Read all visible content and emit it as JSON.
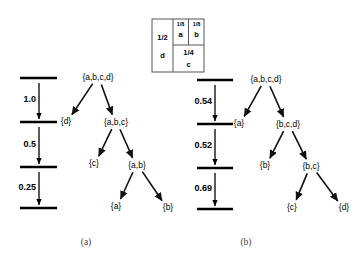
{
  "figure": {
    "caption_a": "(a)",
    "caption_b": "(b)"
  },
  "partition_box": {
    "cells": [
      {
        "name": "left-half",
        "fraction": "1/2",
        "letter": "d"
      },
      {
        "name": "top-right-1",
        "fraction": "1/8",
        "letter": "a"
      },
      {
        "name": "top-right-2",
        "fraction": "1/8",
        "letter": "b"
      },
      {
        "name": "bottom-right",
        "fraction": "1/4",
        "letter": "c"
      }
    ]
  },
  "tree_a": {
    "nodes": [
      {
        "id": "root",
        "label": "{a,b,c,d}",
        "x": 98,
        "y": 78
      },
      {
        "id": "n-d",
        "label": "{d}",
        "x": 66,
        "y": 122
      },
      {
        "id": "n-abc",
        "label": "{a,b,c}",
        "x": 116,
        "y": 123
      },
      {
        "id": "n-c",
        "label": "{c}",
        "x": 94,
        "y": 164
      },
      {
        "id": "n-ab",
        "label": "{a,b}",
        "x": 137,
        "y": 166
      },
      {
        "id": "n-a",
        "label": "{a}",
        "x": 116,
        "y": 207
      },
      {
        "id": "n-b",
        "label": "{b}",
        "x": 168,
        "y": 208
      }
    ],
    "edges": [
      {
        "from": "root",
        "to": "n-d"
      },
      {
        "from": "root",
        "to": "n-abc"
      },
      {
        "from": "n-abc",
        "to": "n-c"
      },
      {
        "from": "n-abc",
        "to": "n-ab"
      },
      {
        "from": "n-ab",
        "to": "n-a"
      },
      {
        "from": "n-ab",
        "to": "n-b"
      }
    ],
    "scale": {
      "bar_x1": 20,
      "bar_x2": 57,
      "arrow_x": 39,
      "levels": [
        78,
        122,
        167,
        208
      ],
      "values": [
        "1.0",
        "0.5",
        "0.25"
      ]
    }
  },
  "tree_b": {
    "nodes": [
      {
        "id": "root",
        "label": "{a,b,c,d}",
        "x": 266,
        "y": 80
      },
      {
        "id": "n-a",
        "label": "{a}",
        "x": 239,
        "y": 124
      },
      {
        "id": "n-bcd",
        "label": "{b,c,d}",
        "x": 288,
        "y": 125
      },
      {
        "id": "n-b",
        "label": "{b}",
        "x": 265,
        "y": 166
      },
      {
        "id": "n-bc",
        "label": "{b,c}",
        "x": 311,
        "y": 167
      },
      {
        "id": "n-c",
        "label": "{c}",
        "x": 292,
        "y": 208
      },
      {
        "id": "n-d",
        "label": "{d}",
        "x": 344,
        "y": 208
      }
    ],
    "edges": [
      {
        "from": "root",
        "to": "n-a"
      },
      {
        "from": "root",
        "to": "n-bcd"
      },
      {
        "from": "n-bcd",
        "to": "n-b"
      },
      {
        "from": "n-bcd",
        "to": "n-bc"
      },
      {
        "from": "n-bc",
        "to": "n-c"
      },
      {
        "from": "n-bc",
        "to": "n-d"
      }
    ],
    "scale": {
      "bar_x1": 197,
      "bar_x2": 233,
      "arrow_x": 215,
      "levels": [
        80,
        124,
        168,
        209
      ],
      "values": [
        "0.54",
        "0.52",
        "0.69"
      ]
    }
  }
}
